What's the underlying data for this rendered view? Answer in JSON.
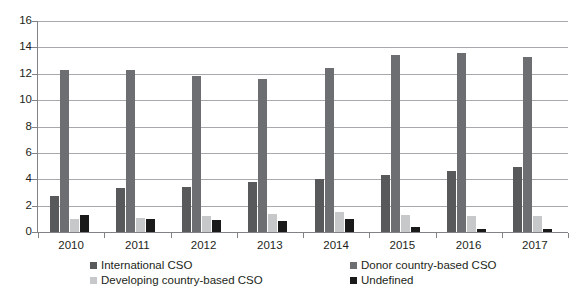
{
  "chart_data": {
    "type": "bar",
    "title": "",
    "subtitle": "",
    "xlabel": "",
    "ylabel": "",
    "categories": [
      "2010",
      "2011",
      "2012",
      "2013",
      "2014",
      "2015",
      "2016",
      "2017"
    ],
    "ylim": [
      0,
      16
    ],
    "yticks": [
      0,
      2,
      4,
      6,
      8,
      10,
      12,
      14,
      16
    ],
    "grid": true,
    "legend_position": "bottom",
    "series": [
      {
        "name": "International CSO",
        "color": "#58595b",
        "values": [
          2.7,
          3.3,
          3.4,
          3.8,
          4.0,
          4.3,
          4.6,
          4.9
        ]
      },
      {
        "name": "Donor country-based CSO",
        "color": "#6d6e71",
        "values": [
          12.3,
          12.3,
          11.8,
          11.6,
          12.4,
          13.4,
          13.6,
          13.3
        ]
      },
      {
        "name": "Developing country-based CSO",
        "color": "#c7c8ca",
        "values": [
          1.0,
          1.1,
          1.2,
          1.4,
          1.5,
          1.3,
          1.2,
          1.2
        ]
      },
      {
        "name": "Undefined",
        "color": "#1a1a1a",
        "values": [
          1.3,
          1.0,
          0.9,
          0.85,
          1.0,
          0.4,
          0.25,
          0.2
        ]
      }
    ]
  },
  "axis": {
    "y_tick_labels": [
      "0",
      "2",
      "4",
      "6",
      "8",
      "10",
      "12",
      "14",
      "16"
    ]
  },
  "legend": {
    "items": [
      {
        "label": "International CSO",
        "color": "#58595b"
      },
      {
        "label": "Donor country-based CSO",
        "color": "#6d6e71"
      },
      {
        "label": "Developing country-based CSO",
        "color": "#c7c8ca"
      },
      {
        "label": "Undefined",
        "color": "#1a1a1a"
      }
    ]
  }
}
